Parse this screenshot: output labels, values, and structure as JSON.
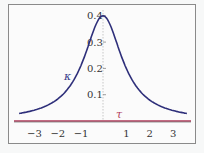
{
  "chart_data": {
    "type": "line",
    "title": "",
    "xlabel": "",
    "ylabel": "",
    "xlim": [
      -3.6,
      3.6
    ],
    "ylim": [
      0,
      0.4
    ],
    "x_ticks": [
      "-3",
      "-2",
      "-1",
      "1",
      "2",
      "3"
    ],
    "y_ticks": [
      "0.1",
      "0.2",
      "0.3",
      "0.4"
    ],
    "grid": false,
    "series": [
      {
        "name": "κ",
        "color": "#2e2f7a",
        "formula": "0.4/(1+t^2)",
        "x": [
          -3.5,
          -3,
          -2.5,
          -2,
          -1.5,
          -1,
          -0.5,
          0,
          0.5,
          1,
          1.5,
          2,
          2.5,
          3,
          3.5
        ],
        "values": [
          0.03,
          0.04,
          0.055,
          0.08,
          0.123,
          0.2,
          0.32,
          0.4,
          0.32,
          0.2,
          0.123,
          0.08,
          0.055,
          0.04,
          0.03
        ]
      },
      {
        "name": "τ",
        "color": "#b03a5a",
        "x": [
          -3.5,
          3.5
        ],
        "values": [
          0,
          0
        ]
      }
    ],
    "annotations": [
      {
        "text": "κ",
        "x": -1.8,
        "y": 0.2
      },
      {
        "text": "τ",
        "x": 0.7,
        "y": 0.03
      }
    ]
  },
  "labels": {
    "kappa": "κ",
    "tau": "τ"
  }
}
